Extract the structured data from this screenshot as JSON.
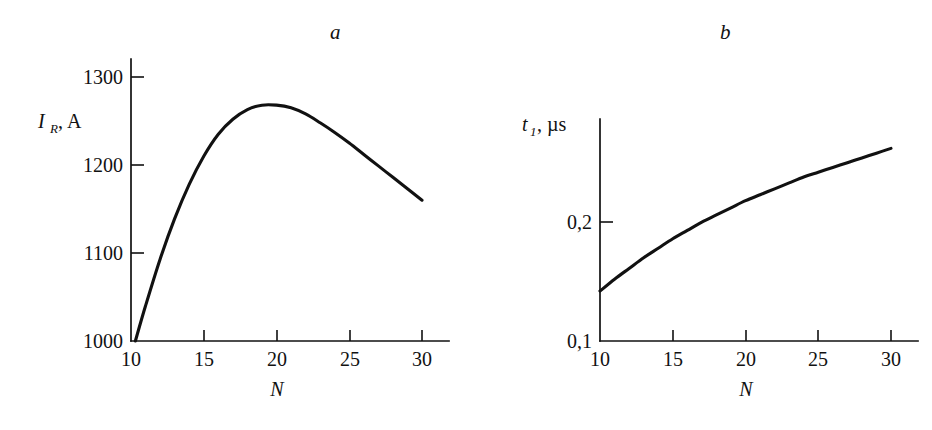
{
  "figure": {
    "background_color": "#ffffff",
    "ink_color": "#111111",
    "panels": [
      {
        "id": "a",
        "label": "a",
        "xlabel": "N",
        "ylabel_symbol": "I",
        "ylabel_subscript": "R",
        "ylabel_units": ", A",
        "ylabel_full": "I_R, A",
        "x_ticks": [
          "10",
          "15",
          "20",
          "25",
          "30"
        ],
        "y_ticks": [
          "1000",
          "1100",
          "1200",
          "1300"
        ]
      },
      {
        "id": "b",
        "label": "b",
        "xlabel": "N",
        "ylabel_symbol": "t",
        "ylabel_subscript": "1",
        "ylabel_units": ",  µs",
        "ylabel_full": "t_1, µs",
        "x_ticks": [
          "10",
          "15",
          "20",
          "25",
          "30"
        ],
        "y_ticks": [
          "0,1",
          "0,2"
        ]
      }
    ]
  },
  "chart_data": [
    {
      "type": "line",
      "panel": "a",
      "title": "a",
      "xlabel": "N",
      "ylabel": "I_R, A",
      "xlim": [
        10,
        30
      ],
      "ylim": [
        1000,
        1300
      ],
      "xticks": [
        10,
        15,
        20,
        25,
        30
      ],
      "yticks": [
        1000,
        1100,
        1200,
        1300
      ],
      "grid": false,
      "legend": null,
      "series": [
        {
          "name": "I_R(N)",
          "x": [
            10.3,
            11,
            12,
            13,
            14,
            15,
            16,
            17,
            18,
            19,
            20,
            21,
            22,
            23,
            24,
            25,
            26,
            27,
            28,
            29,
            30
          ],
          "y": [
            1000,
            1040,
            1093,
            1139,
            1178,
            1210,
            1235,
            1252,
            1263,
            1268,
            1268,
            1265,
            1258,
            1248,
            1237,
            1225,
            1212,
            1199,
            1186,
            1173,
            1160
          ]
        }
      ],
      "annotations": [
        {
          "text": "peak",
          "x": 20,
          "y": 1268
        }
      ]
    },
    {
      "type": "line",
      "panel": "b",
      "title": "b",
      "xlabel": "N",
      "ylabel": "t_1, µs",
      "xlim": [
        10,
        30
      ],
      "ylim": [
        0.1,
        0.28
      ],
      "xticks": [
        10,
        15,
        20,
        25,
        30
      ],
      "yticks": [
        0.1,
        0.2
      ],
      "grid": false,
      "legend": null,
      "series": [
        {
          "name": "t_1(N)",
          "x": [
            10,
            11,
            12,
            13,
            14,
            15,
            16,
            17,
            18,
            19,
            20,
            21,
            22,
            23,
            24,
            25,
            26,
            27,
            28,
            29,
            30
          ],
          "y": [
            0.142,
            0.152,
            0.161,
            0.17,
            0.178,
            0.186,
            0.193,
            0.2,
            0.206,
            0.212,
            0.218,
            0.223,
            0.228,
            0.233,
            0.238,
            0.242,
            0.246,
            0.25,
            0.254,
            0.258,
            0.262
          ]
        }
      ]
    }
  ]
}
